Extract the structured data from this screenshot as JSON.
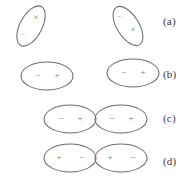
{
  "figure": {
    "background_color": "#ffffff",
    "stroke_color": "#6b6b6b",
    "mark_color": "#6f6f6f",
    "label_color": "#3a3a3a",
    "rows": [
      {
        "id": "row-a",
        "label": "(a)",
        "label_x": 163,
        "label_y": 15,
        "arrangement": "separated-tilted",
        "shapes": [
          {
            "id": "a-left",
            "cx": 31,
            "cy": 26,
            "rx": 11,
            "ry": 22,
            "rotation": 28,
            "marks": [
              {
                "glyph": "×",
                "x": 36,
                "y": 18,
                "size": "normal",
                "name": "cross-mark"
              },
              {
                "glyph": "−",
                "x": 23,
                "y": 35,
                "size": "tiny",
                "name": "dash-mark"
              }
            ]
          },
          {
            "id": "a-right",
            "cx": 128,
            "cy": 26,
            "rx": 11,
            "ry": 22,
            "rotation": -32,
            "marks": [
              {
                "glyph": "−",
                "x": 119,
                "y": 17,
                "size": "tiny",
                "name": "dash-mark"
              },
              {
                "glyph": "×",
                "x": 133,
                "y": 30,
                "size": "normal",
                "name": "cross-mark"
              }
            ]
          }
        ]
      },
      {
        "id": "row-b",
        "label": "(b)",
        "label_x": 163,
        "label_y": 68,
        "arrangement": "separated-horizontal",
        "shapes": [
          {
            "id": "b-left",
            "cx": 47,
            "cy": 76,
            "rx": 26,
            "ry": 14,
            "rotation": 0,
            "marks": [
              {
                "glyph": "−",
                "x": 38,
                "y": 76,
                "size": "normal",
                "name": "minus-mark"
              },
              {
                "glyph": "+",
                "x": 57,
                "y": 76,
                "size": "normal",
                "name": "plus-mark"
              }
            ]
          },
          {
            "id": "b-right",
            "cx": 133,
            "cy": 73,
            "rx": 26,
            "ry": 14,
            "rotation": 0,
            "marks": [
              {
                "glyph": "−",
                "x": 124,
                "y": 73,
                "size": "normal",
                "name": "minus-mark"
              },
              {
                "glyph": "+",
                "x": 143,
                "y": 73,
                "size": "normal",
                "name": "plus-mark"
              }
            ]
          }
        ]
      },
      {
        "id": "row-c",
        "label": "(c)",
        "label_x": 163,
        "label_y": 112,
        "arrangement": "touching-horizontal",
        "shapes": [
          {
            "id": "c-left",
            "cx": 70,
            "cy": 119,
            "rx": 26,
            "ry": 14,
            "rotation": 0,
            "marks": [
              {
                "glyph": "−",
                "x": 61,
                "y": 119,
                "size": "normal",
                "name": "minus-mark"
              },
              {
                "glyph": "+",
                "x": 80,
                "y": 119,
                "size": "normal",
                "name": "plus-mark"
              }
            ]
          },
          {
            "id": "c-right",
            "cx": 121,
            "cy": 119,
            "rx": 26,
            "ry": 14,
            "rotation": 0,
            "marks": [
              {
                "glyph": "−",
                "x": 112,
                "y": 119,
                "size": "normal",
                "name": "minus-mark"
              },
              {
                "glyph": "+",
                "x": 131,
                "y": 119,
                "size": "normal",
                "name": "plus-mark"
              }
            ]
          }
        ]
      },
      {
        "id": "row-d",
        "label": "(d)",
        "label_x": 163,
        "label_y": 155,
        "arrangement": "touching-horizontal",
        "shapes": [
          {
            "id": "d-left",
            "cx": 70,
            "cy": 158,
            "rx": 26,
            "ry": 14,
            "rotation": 0,
            "marks": [
              {
                "glyph": "+",
                "x": 59,
                "y": 158,
                "size": "normal",
                "name": "plus-mark"
              },
              {
                "glyph": "−",
                "x": 82,
                "y": 158,
                "size": "normal",
                "name": "minus-mark"
              }
            ]
          },
          {
            "id": "d-right",
            "cx": 121,
            "cy": 158,
            "rx": 26,
            "ry": 14,
            "rotation": 0,
            "marks": [
              {
                "glyph": "+",
                "x": 110,
                "y": 158,
                "size": "normal",
                "name": "plus-mark"
              },
              {
                "glyph": "−",
                "x": 133,
                "y": 158,
                "size": "normal",
                "name": "minus-mark"
              }
            ]
          }
        ]
      }
    ]
  }
}
